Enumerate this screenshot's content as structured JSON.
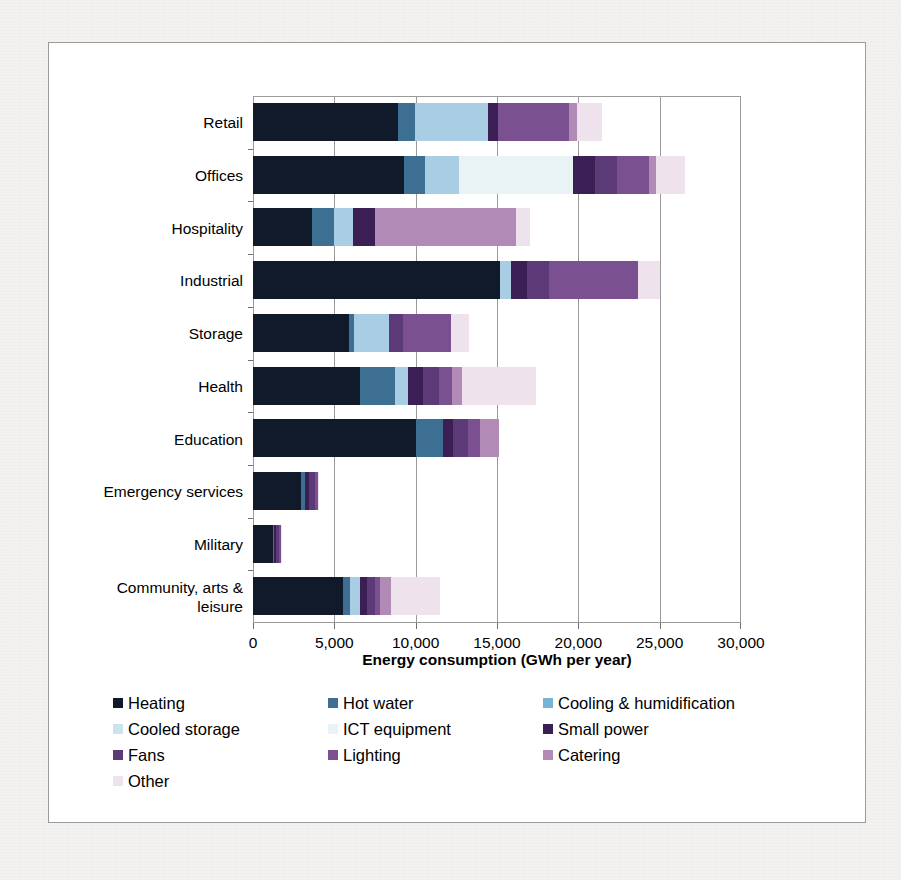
{
  "chart_data": {
    "type": "bar",
    "orientation": "horizontal",
    "stacked": true,
    "title": "",
    "xlabel": "Energy consumption (GWh per year)",
    "ylabel": "",
    "xlim": [
      0,
      30000
    ],
    "xticks": [
      0,
      5000,
      10000,
      15000,
      20000,
      25000,
      30000
    ],
    "xticklabels": [
      "0",
      "5,000",
      "10,000",
      "15,000",
      "20,000",
      "25,000",
      "30,000"
    ],
    "grid": "vertical",
    "legend_position": "below",
    "categories": [
      "Retail",
      "Offices",
      "Hospitality",
      "Industrial",
      "Storage",
      "Health",
      "Education",
      "Emergency services",
      "Military",
      "Community, arts & leisure"
    ],
    "series": [
      {
        "name": "Heating",
        "color": "#111a2b",
        "values": [
          8900,
          9300,
          3600,
          15200,
          5900,
          6600,
          10000,
          2950,
          1200,
          5550
        ]
      },
      {
        "name": "Hot water",
        "color": "#3c6f92",
        "values": [
          1050,
          1250,
          1400,
          0,
          300,
          2100,
          1700,
          250,
          100,
          400
        ]
      },
      {
        "name": "Cooling & humidification",
        "color": "#a9cde2",
        "values": [
          4500,
          2100,
          1150,
          650,
          2150,
          800,
          0,
          0,
          0,
          600
        ]
      },
      {
        "name": "Cooled storage",
        "color": "#c9e3ef",
        "values": [
          0,
          0,
          0,
          0,
          0,
          0,
          0,
          0,
          0,
          0
        ]
      },
      {
        "name": "ICT equipment",
        "color": "#e9f3f5",
        "values": [
          0,
          7000,
          0,
          0,
          0,
          0,
          0,
          0,
          0,
          0
        ]
      },
      {
        "name": "Small power",
        "color": "#3b1f54",
        "values": [
          600,
          1350,
          1350,
          1000,
          0,
          950,
          600,
          250,
          100,
          450
        ]
      },
      {
        "name": "Fans",
        "color": "#5b3a77",
        "values": [
          0,
          1400,
          0,
          1350,
          850,
          1000,
          900,
          350,
          180,
          500
        ]
      },
      {
        "name": "Lighting",
        "color": "#7a5091",
        "values": [
          4400,
          1950,
          0,
          5450,
          2950,
          800,
          750,
          200,
          120,
          300
        ]
      },
      {
        "name": "Catering",
        "color": "#b18bb6",
        "values": [
          450,
          450,
          8700,
          0,
          0,
          600,
          1200,
          0,
          0,
          700
        ]
      },
      {
        "name": "Other",
        "color": "#eee2ec",
        "values": [
          1550,
          1750,
          850,
          1400,
          1150,
          4550,
          0,
          50,
          30,
          3000
        ]
      }
    ]
  },
  "legend": {
    "rows": [
      [
        {
          "label": "Heating",
          "color": "#111a2b"
        },
        {
          "label": "Hot water",
          "color": "#3c6f92"
        },
        {
          "label": "Cooling & humidification",
          "color": "#79b3d3"
        }
      ],
      [
        {
          "label": "Cooled storage",
          "color": "#c9e3ef"
        },
        {
          "label": "ICT equipment",
          "color": "#e9f3f5"
        },
        {
          "label": "Small power",
          "color": "#3b1f54"
        }
      ],
      [
        {
          "label": "Fans",
          "color": "#5b3a77"
        },
        {
          "label": "Lighting",
          "color": "#7a5091"
        },
        {
          "label": "Catering",
          "color": "#b18bb6"
        }
      ],
      [
        {
          "label": "Other",
          "color": "#eee2ec"
        }
      ]
    ]
  }
}
